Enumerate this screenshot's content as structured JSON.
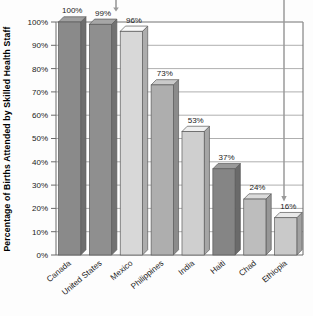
{
  "chart_data": {
    "type": "bar",
    "title": "",
    "subtitle": "",
    "xlabel": "",
    "ylabel": "Percentage of Births Attended by Skilled Health Staff",
    "categories": [
      "Canada",
      "United States",
      "Mexico",
      "Philippines",
      "India",
      "Haiti",
      "Chad",
      "Ethiopia"
    ],
    "values": [
      100,
      99,
      96,
      73,
      53,
      37,
      24,
      16
    ],
    "value_labels": [
      "100%",
      "99%",
      "96%",
      "73%",
      "53%",
      "37%",
      "24%",
      "16%"
    ],
    "ylim": [
      0,
      100
    ],
    "ytick_values": [
      0,
      10,
      20,
      30,
      40,
      50,
      60,
      70,
      80,
      90,
      100
    ],
    "ytick_labels": [
      "0%",
      "10%",
      "20%",
      "30%",
      "40%",
      "50%",
      "60%",
      "70%",
      "80%",
      "90%",
      "100%"
    ],
    "grid": true,
    "grid_axis": "y",
    "legend": false,
    "legend_position": "none",
    "bar_style": "3d",
    "bar_colors": [
      "#8a8a8a",
      "#8f8f8f",
      "#d8d8d8",
      "#aeaeae",
      "#cfcfcf",
      "#858585",
      "#bdbdbd",
      "#c9c9c9"
    ],
    "annotations": [
      {
        "name": "top-pointer",
        "x_category": "United States",
        "label": ""
      },
      {
        "name": "ethiopia-pointer",
        "x_category": "Ethiopia",
        "label": ""
      }
    ]
  },
  "axis": {
    "y_title": "Percentage of Births Attended by Skilled Health Staff"
  },
  "colors": {
    "plot_background": "#ffffff",
    "grid_line": "#9a9a9a",
    "axis_line": "#6b6b6b",
    "text": "#1a1a1a",
    "pointer": "#9a9a9a"
  }
}
